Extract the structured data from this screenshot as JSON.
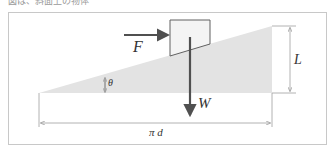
{
  "caption": "図は、斜面上の物体",
  "diagram": {
    "labels": {
      "force_F": "F",
      "weight_W": "W",
      "angle": "θ",
      "height": "L",
      "base": "π d"
    },
    "colors": {
      "slope_fill": "#e3e3e3",
      "block_fill": "#f4f4f4",
      "arrow": "#505050",
      "dim_line": "#a0a0a0",
      "frame": "#c8c8c8"
    }
  }
}
